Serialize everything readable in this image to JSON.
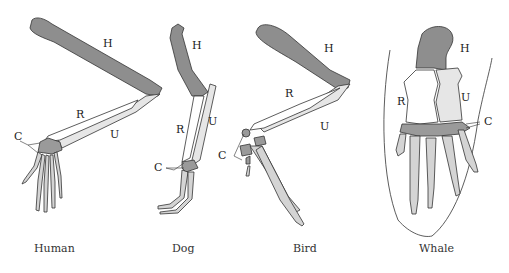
{
  "diagram": {
    "type": "homologous-structures-forelimb-comparison",
    "colors": {
      "humerus": "#8e8e8e",
      "radius": "#ffffff",
      "ulna": "#e6e6e6",
      "carpals": "#9a9a9a",
      "phalanges": "#d4d4d4",
      "outline": "#333333"
    },
    "bone_labels": {
      "humerus": "H",
      "radius": "R",
      "ulna": "U",
      "carpals": "C"
    },
    "panels": [
      {
        "id": "human",
        "caption": "Human",
        "labels": {
          "H": "H",
          "R": "R",
          "U": "U",
          "C": "C"
        }
      },
      {
        "id": "dog",
        "caption": "Dog",
        "labels": {
          "H": "H",
          "R": "R",
          "U": "U",
          "C": "C"
        }
      },
      {
        "id": "bird",
        "caption": "Bird",
        "labels": {
          "H": "H",
          "R": "R",
          "U": "U",
          "C": "C"
        }
      },
      {
        "id": "whale",
        "caption": "Whale",
        "labels": {
          "H": "H",
          "R": "R",
          "U": "U",
          "C": "C"
        }
      }
    ]
  }
}
